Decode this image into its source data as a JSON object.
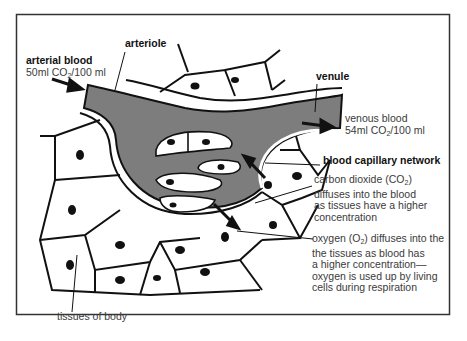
{
  "diagram": {
    "colors": {
      "blood": "#7d7d7d",
      "outline": "#111111",
      "text": "#3a3a3a",
      "background": "#ffffff"
    },
    "labels": {
      "arteriole": "arteriole",
      "arterial_blood_title": "arterial blood",
      "arterial_blood_value_pre": "50ml CO",
      "arterial_blood_value_sub": "2",
      "arterial_blood_value_post": "/100 ml",
      "venule": "venule",
      "venous_blood_title": "venous blood",
      "venous_blood_value_pre": "54ml CO",
      "venous_blood_value_sub": "2",
      "venous_blood_value_post": "/100 ml",
      "capillary_network": "blood capillary network",
      "co2_line1_pre": "carbon dioxide (CO",
      "co2_line1_sub": "2",
      "co2_line1_post": ")",
      "co2_line2": "diffuses into the blood",
      "co2_line3": "as tissues have a higher",
      "co2_line4": "concentration",
      "o2_line1_pre": "oxygen (O",
      "o2_line1_sub": "2",
      "o2_line1_post": ") diffuses into the",
      "o2_line2": "the tissues as blood has",
      "o2_line3": "a higher concentration—",
      "o2_line4": "oxygen is used up by living",
      "o2_line5": "cells during respiration",
      "tissues": "tissues of body"
    }
  }
}
